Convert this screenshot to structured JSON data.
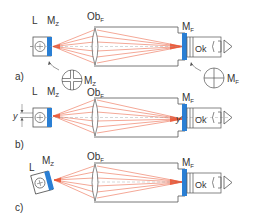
{
  "diagram": {
    "type": "optical-schematic",
    "colors": {
      "line": "#555555",
      "ray": "#e8502e",
      "mark": "#2a7fd4",
      "background": "#ffffff"
    },
    "panels": [
      {
        "id": "a",
        "label": "a)",
        "labels": {
          "lamp": "L",
          "target_mark": "M",
          "target_mark_sub": "Z",
          "objective": "Ob",
          "objective_sub": "F",
          "focus_mark": "M",
          "focus_mark_sub": "F",
          "eyepiece": "Ok"
        },
        "insets": [
          {
            "name": "reticle-Mz",
            "symbol": "double-line cross",
            "label": "M",
            "label_sub": "Z"
          },
          {
            "name": "reticle-Mf",
            "symbol": "crosshair",
            "label": "M",
            "label_sub": "F"
          }
        ]
      },
      {
        "id": "b",
        "label": "b)",
        "labels": {
          "lamp": "L",
          "target_mark": "M",
          "target_mark_sub": "Z",
          "objective": "Ob",
          "objective_sub": "F",
          "focus_mark": "M",
          "focus_mark_sub": "F",
          "eyepiece": "Ok",
          "offset_left": "y",
          "offset_right": "y'"
        }
      },
      {
        "id": "c",
        "label": "c)",
        "labels": {
          "lamp": "L",
          "target_mark": "M",
          "target_mark_sub": "Z",
          "objective": "Ob",
          "objective_sub": "F",
          "focus_mark": "M",
          "focus_mark_sub": "F",
          "eyepiece": "Ok"
        },
        "note": "lamp/target unit tilted"
      }
    ]
  }
}
